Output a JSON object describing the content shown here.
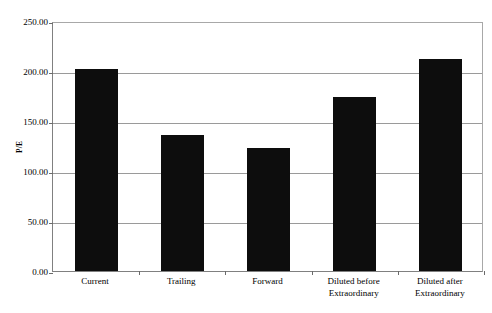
{
  "chart_data": {
    "type": "bar",
    "title": "",
    "subtitle": "",
    "xlabel": "",
    "ylabel": "P/E",
    "categories": [
      "Current",
      "Trailing",
      "Forward",
      "Diluted before\nExtraordinary",
      "Diluted after\nExtraordinary"
    ],
    "values": [
      202.0,
      136.0,
      123.0,
      174.0,
      212.0
    ],
    "ylim": [
      0,
      250
    ],
    "yticks": [
      0,
      50,
      100,
      150,
      200,
      250
    ],
    "ytick_labels": [
      "0.00",
      "50.00",
      "100.00",
      "150.00",
      "200.00",
      "250.00"
    ],
    "grid": true,
    "legend": false,
    "legend_position": "none",
    "bar_color": "#0d0d0d",
    "grid_color": "#9a9a9a",
    "frame_color": "#8c8c8c",
    "background_color": "#ffffff"
  }
}
